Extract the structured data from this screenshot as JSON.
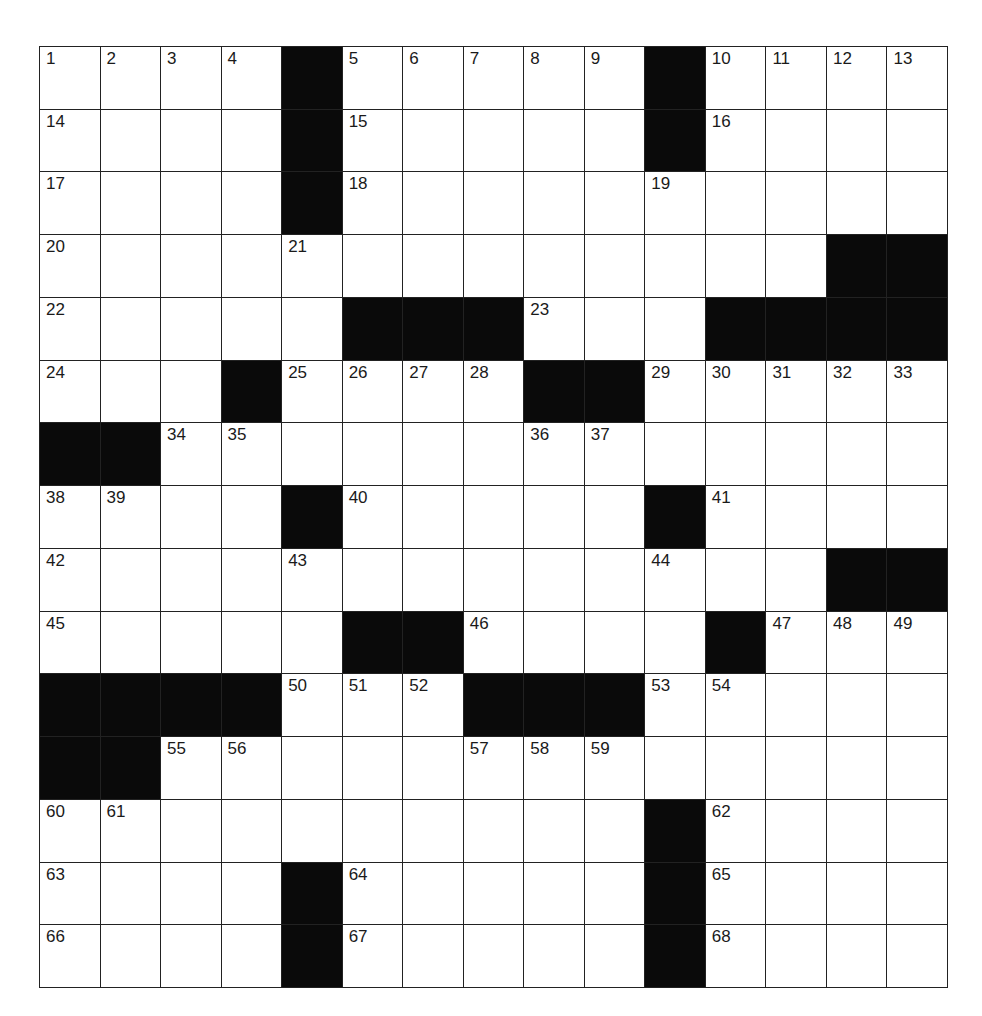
{
  "puzzle": {
    "rows": 15,
    "cols": 15,
    "layout": [
      "....#.....#....",
      "....#.....#....",
      "....#..........",
      ".............##",
      ".....###...####",
      "...#....##.....",
      "##.............",
      "....#.....#....",
      ".............##",
      ".....##....#...",
      "####...###.....",
      "##.............",
      "..........#....",
      "....#.....#....",
      "....#.....#...."
    ],
    "numbers": [
      {
        "r": 0,
        "c": 0,
        "n": "1"
      },
      {
        "r": 0,
        "c": 1,
        "n": "2"
      },
      {
        "r": 0,
        "c": 2,
        "n": "3"
      },
      {
        "r": 0,
        "c": 3,
        "n": "4"
      },
      {
        "r": 0,
        "c": 5,
        "n": "5"
      },
      {
        "r": 0,
        "c": 6,
        "n": "6"
      },
      {
        "r": 0,
        "c": 7,
        "n": "7"
      },
      {
        "r": 0,
        "c": 8,
        "n": "8"
      },
      {
        "r": 0,
        "c": 9,
        "n": "9"
      },
      {
        "r": 0,
        "c": 11,
        "n": "10"
      },
      {
        "r": 0,
        "c": 12,
        "n": "11"
      },
      {
        "r": 0,
        "c": 13,
        "n": "12"
      },
      {
        "r": 0,
        "c": 14,
        "n": "13"
      },
      {
        "r": 1,
        "c": 0,
        "n": "14"
      },
      {
        "r": 1,
        "c": 5,
        "n": "15"
      },
      {
        "r": 1,
        "c": 11,
        "n": "16"
      },
      {
        "r": 2,
        "c": 0,
        "n": "17"
      },
      {
        "r": 2,
        "c": 5,
        "n": "18"
      },
      {
        "r": 2,
        "c": 10,
        "n": "19"
      },
      {
        "r": 3,
        "c": 0,
        "n": "20"
      },
      {
        "r": 3,
        "c": 4,
        "n": "21"
      },
      {
        "r": 4,
        "c": 0,
        "n": "22"
      },
      {
        "r": 4,
        "c": 8,
        "n": "23"
      },
      {
        "r": 5,
        "c": 0,
        "n": "24"
      },
      {
        "r": 5,
        "c": 4,
        "n": "25"
      },
      {
        "r": 5,
        "c": 5,
        "n": "26"
      },
      {
        "r": 5,
        "c": 6,
        "n": "27"
      },
      {
        "r": 5,
        "c": 7,
        "n": "28"
      },
      {
        "r": 5,
        "c": 10,
        "n": "29"
      },
      {
        "r": 5,
        "c": 11,
        "n": "30"
      },
      {
        "r": 5,
        "c": 12,
        "n": "31"
      },
      {
        "r": 5,
        "c": 13,
        "n": "32"
      },
      {
        "r": 5,
        "c": 14,
        "n": "33"
      },
      {
        "r": 6,
        "c": 2,
        "n": "34"
      },
      {
        "r": 6,
        "c": 3,
        "n": "35"
      },
      {
        "r": 6,
        "c": 8,
        "n": "36"
      },
      {
        "r": 6,
        "c": 9,
        "n": "37"
      },
      {
        "r": 7,
        "c": 0,
        "n": "38"
      },
      {
        "r": 7,
        "c": 1,
        "n": "39"
      },
      {
        "r": 7,
        "c": 5,
        "n": "40"
      },
      {
        "r": 7,
        "c": 11,
        "n": "41"
      },
      {
        "r": 8,
        "c": 0,
        "n": "42"
      },
      {
        "r": 8,
        "c": 4,
        "n": "43"
      },
      {
        "r": 8,
        "c": 10,
        "n": "44"
      },
      {
        "r": 9,
        "c": 0,
        "n": "45"
      },
      {
        "r": 9,
        "c": 7,
        "n": "46"
      },
      {
        "r": 9,
        "c": 12,
        "n": "47"
      },
      {
        "r": 9,
        "c": 13,
        "n": "48"
      },
      {
        "r": 9,
        "c": 14,
        "n": "49"
      },
      {
        "r": 10,
        "c": 4,
        "n": "50"
      },
      {
        "r": 10,
        "c": 5,
        "n": "51"
      },
      {
        "r": 10,
        "c": 6,
        "n": "52"
      },
      {
        "r": 10,
        "c": 10,
        "n": "53"
      },
      {
        "r": 10,
        "c": 11,
        "n": "54"
      },
      {
        "r": 11,
        "c": 2,
        "n": "55"
      },
      {
        "r": 11,
        "c": 3,
        "n": "56"
      },
      {
        "r": 11,
        "c": 7,
        "n": "57"
      },
      {
        "r": 11,
        "c": 8,
        "n": "58"
      },
      {
        "r": 11,
        "c": 9,
        "n": "59"
      },
      {
        "r": 12,
        "c": 0,
        "n": "60"
      },
      {
        "r": 12,
        "c": 1,
        "n": "61"
      },
      {
        "r": 12,
        "c": 11,
        "n": "62"
      },
      {
        "r": 13,
        "c": 0,
        "n": "63"
      },
      {
        "r": 13,
        "c": 5,
        "n": "64"
      },
      {
        "r": 13,
        "c": 11,
        "n": "65"
      },
      {
        "r": 14,
        "c": 0,
        "n": "66"
      },
      {
        "r": 14,
        "c": 5,
        "n": "67"
      },
      {
        "r": 14,
        "c": 11,
        "n": "68"
      }
    ],
    "colors": {
      "block": "#0a0a0a",
      "cell": "#ffffff",
      "line": "#222222"
    }
  }
}
